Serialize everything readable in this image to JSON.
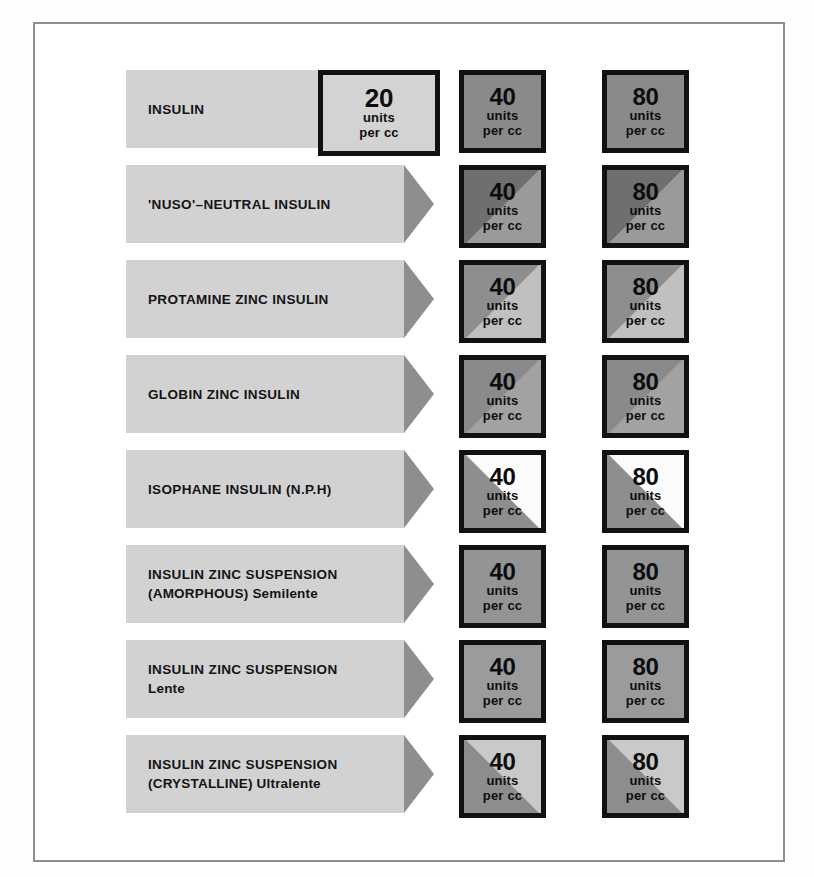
{
  "page": {
    "units_line1": "units",
    "units_line2": "per cc",
    "frame_color": "#8d8d8d",
    "banner_body_color": "#d2d2d2",
    "banner_head_color": "#8e8e8e"
  },
  "rows": [
    {
      "name": "insulin",
      "label_line1": "INSULIN",
      "label_line2": "",
      "doses": [
        {
          "value": "20",
          "units_line1": "units",
          "units_line2": "per cc",
          "fill_top": "#d3d3d3",
          "fill_bottom": "#d3d3d3",
          "split": "none"
        },
        {
          "value": "40",
          "units_line1": "units",
          "units_line2": "per cc",
          "fill_top": "#8a8a8a",
          "fill_bottom": "#8a8a8a",
          "split": "none"
        },
        {
          "value": "80",
          "units_line1": "units",
          "units_line2": "per cc",
          "fill_top": "#8a8a8a",
          "fill_bottom": "#8a8a8a",
          "split": "none"
        }
      ]
    },
    {
      "name": "nuso-neutral-insulin",
      "label_line1": "'NUSO'–NEUTRAL INSULIN",
      "label_line2": "",
      "doses": [
        {
          "value": "40",
          "units_line1": "units",
          "units_line2": "per cc",
          "fill_top": "#6f6f6f",
          "fill_bottom": "#9a9a9a",
          "split": "diag-tl-dark"
        },
        {
          "value": "80",
          "units_line1": "units",
          "units_line2": "per cc",
          "fill_top": "#6f6f6f",
          "fill_bottom": "#9a9a9a",
          "split": "diag-tl-dark"
        }
      ]
    },
    {
      "name": "protamine-zinc-insulin",
      "label_line1": "PROTAMINE ZINC INSULIN",
      "label_line2": "",
      "doses": [
        {
          "value": "40",
          "units_line1": "units",
          "units_line2": "per cc",
          "fill_top": "#8e8e8e",
          "fill_bottom": "#c0c0c0",
          "split": "diag-tl-dark"
        },
        {
          "value": "80",
          "units_line1": "units",
          "units_line2": "per cc",
          "fill_top": "#8e8e8e",
          "fill_bottom": "#c0c0c0",
          "split": "diag-tl-dark"
        }
      ]
    },
    {
      "name": "globin-zinc-insulin",
      "label_line1": "GLOBIN ZINC INSULIN",
      "label_line2": "",
      "doses": [
        {
          "value": "40",
          "units_line1": "units",
          "units_line2": "per cc",
          "fill_top": "#8a8a8a",
          "fill_bottom": "#a2a2a2",
          "split": "diag-tl-dark"
        },
        {
          "value": "80",
          "units_line1": "units",
          "units_line2": "per cc",
          "fill_top": "#8a8a8a",
          "fill_bottom": "#a2a2a2",
          "split": "diag-tl-dark"
        }
      ]
    },
    {
      "name": "isophane-insulin-nph",
      "label_line1": "ISOPHANE INSULIN (N.P.H)",
      "label_line2": "",
      "doses": [
        {
          "value": "40",
          "units_line1": "units",
          "units_line2": "per cc",
          "fill_top": "#fbfbfb",
          "fill_bottom": "#8e8e8e",
          "split": "diag-bl-dark"
        },
        {
          "value": "80",
          "units_line1": "units",
          "units_line2": "per cc",
          "fill_top": "#fbfbfb",
          "fill_bottom": "#8e8e8e",
          "split": "diag-bl-dark"
        }
      ]
    },
    {
      "name": "insulin-zinc-suspension-amorphous-semilente",
      "label_line1": "INSULIN ZINC SUSPENSION",
      "label_line2": "(AMORPHOUS) Semilente",
      "doses": [
        {
          "value": "40",
          "units_line1": "units",
          "units_line2": "per cc",
          "fill_top": "#949494",
          "fill_bottom": "#949494",
          "split": "none"
        },
        {
          "value": "80",
          "units_line1": "units",
          "units_line2": "per cc",
          "fill_top": "#949494",
          "fill_bottom": "#949494",
          "split": "none"
        }
      ]
    },
    {
      "name": "insulin-zinc-suspension-lente",
      "label_line1": "INSULIN ZINC SUSPENSION",
      "label_line2": "Lente",
      "doses": [
        {
          "value": "40",
          "units_line1": "units",
          "units_line2": "per cc",
          "fill_top": "#9b9b9b",
          "fill_bottom": "#9b9b9b",
          "split": "none"
        },
        {
          "value": "80",
          "units_line1": "units",
          "units_line2": "per cc",
          "fill_top": "#9b9b9b",
          "fill_bottom": "#9b9b9b",
          "split": "none"
        }
      ]
    },
    {
      "name": "insulin-zinc-suspension-crystalline-ultralente",
      "label_line1": "INSULIN ZINC SUSPENSION",
      "label_line2": "(CRYSTALLINE) Ultralente",
      "doses": [
        {
          "value": "40",
          "units_line1": "units",
          "units_line2": "per cc",
          "fill_top": "#c9c9c9",
          "fill_bottom": "#8d8d8d",
          "split": "diag-bl-dark"
        },
        {
          "value": "80",
          "units_line1": "units",
          "units_line2": "per cc",
          "fill_top": "#c9c9c9",
          "fill_bottom": "#8d8d8d",
          "split": "diag-bl-dark"
        }
      ]
    }
  ],
  "layout": {
    "row_top_start": 70,
    "row_step": 95,
    "columns": [
      "col-20",
      "col-40",
      "col-80"
    ]
  }
}
